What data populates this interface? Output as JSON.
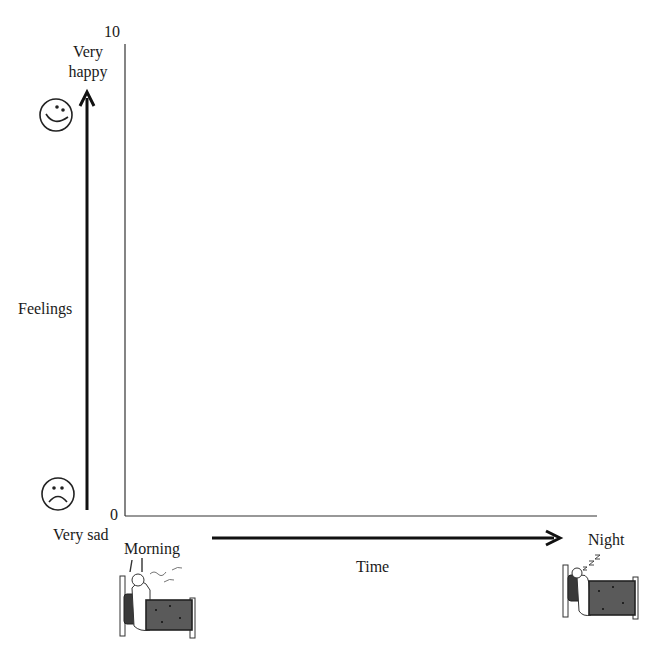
{
  "diagram": {
    "y_axis": {
      "label": "Feelings",
      "top_tick": "10",
      "bottom_tick": "0",
      "top_label_line1": "Very",
      "top_label_line2": "happy",
      "bottom_label": "Very sad",
      "top_icon": "happy-face-icon",
      "bottom_icon": "sad-face-icon"
    },
    "x_axis": {
      "label": "Time",
      "start_label": "Morning",
      "end_label": "Night",
      "start_icon": "waking-up-in-bed-icon",
      "end_icon": "sleeping-in-bed-icon"
    },
    "colors": {
      "ink": "#1a1a1a",
      "blanket": "#555555",
      "background": "#ffffff"
    }
  }
}
